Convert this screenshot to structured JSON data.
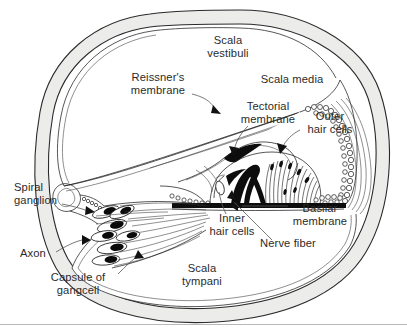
{
  "figure": {
    "kind": "anatomical-diagram",
    "background_color": "#ffffff",
    "ink_color": "#1f1f1f",
    "wall_color": "#ececeb",
    "label_color": "#2b2b2b"
  },
  "labels": {
    "scala_vestibuli": {
      "line1": "Scala",
      "line2": "vestibuli"
    },
    "scala_media": {
      "line1": "Scala media"
    },
    "scala_tympani": {
      "line1": "Scala",
      "line2": "tympani"
    },
    "reissners_membrane": {
      "line1": "Reissner's",
      "line2": "membrane"
    },
    "tectorial_membrane": {
      "line1": "Tectorial",
      "line2": "membrane"
    },
    "outer_hair_cells": {
      "line1": "Outer",
      "line2": "hair cells"
    },
    "inner_hair_cells": {
      "line1": "Inner",
      "line2": "hair cells"
    },
    "basilar_membrane": {
      "line1": "Basilar",
      "line2": "membrane"
    },
    "nerve_fiber": {
      "line1": "Nerve fiber"
    },
    "spiral_ganglion": {
      "line1": "Spiral",
      "line2": "ganglion"
    },
    "axon": {
      "line1": "Axon"
    },
    "capsule_of_gangcell": {
      "line1": "Capsule of",
      "line2": "gangcell"
    }
  }
}
